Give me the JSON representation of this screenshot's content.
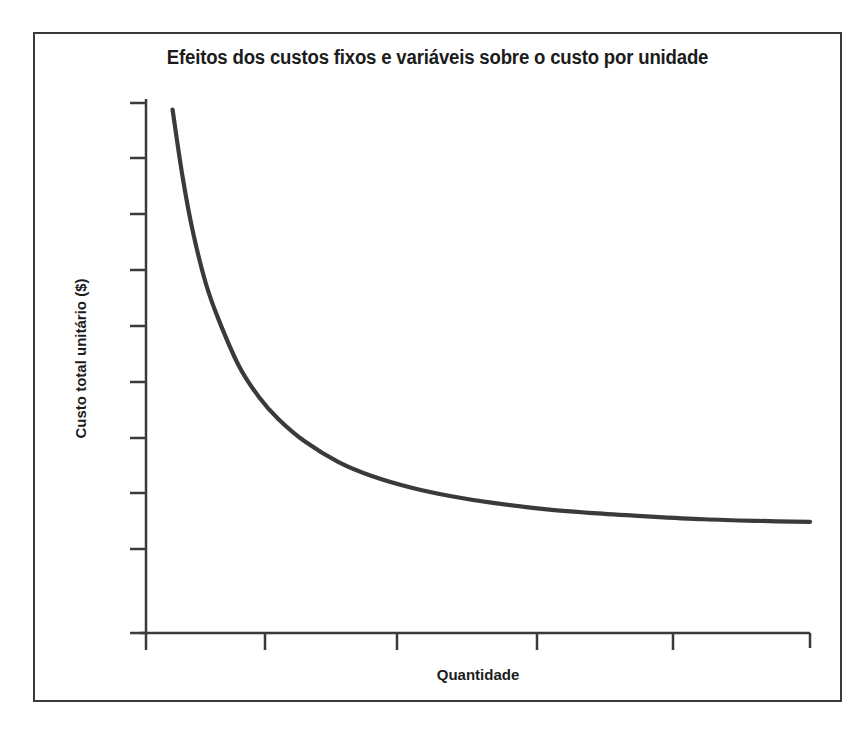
{
  "figure": {
    "title": "Efeitos dos custos fixos e variáveis sobre o custo por unidade",
    "frame_color": "#3a3a3a",
    "background_color": "#ffffff"
  },
  "axes": {
    "x_label": "Quantidade",
    "y_label": "Custo total unitário ($)",
    "axis_color": "#3a3a3a",
    "curve_color": "#3a3a3a"
  },
  "chart_data": {
    "type": "line",
    "title": "Efeitos dos custos fixos e variáveis sobre o custo por unidade",
    "xlabel": "Quantidade",
    "ylabel": "Custo total unitário ($)",
    "grid": false,
    "legend": null,
    "xlim": [
      0,
      10
    ],
    "ylim": [
      0,
      10
    ],
    "x_tick_labels": [],
    "y_tick_labels": [],
    "x_tick_count": 5,
    "y_tick_count": 10,
    "x_ticks": [
      2,
      4,
      6,
      8,
      10
    ],
    "y_ticks": [
      1,
      2,
      3,
      4,
      5,
      6,
      7,
      8,
      9,
      10
    ],
    "series": [
      {
        "name": "Custo total unitário",
        "description": "Curva decrescente hiperbólica: custo por unidade cai rapidamente e tende a uma assíntota horizontal",
        "x": [
          0.4,
          0.55,
          0.7,
          0.9,
          1.1,
          1.4,
          1.7,
          2.0,
          2.4,
          2.9,
          3.4,
          4.0,
          4.6,
          5.2,
          6.0,
          6.8,
          7.6,
          8.4,
          9.2,
          10.0
        ],
        "y": [
          9.8,
          8.55,
          7.55,
          6.55,
          5.85,
          5.0,
          4.42,
          4.0,
          3.58,
          3.2,
          2.94,
          2.72,
          2.56,
          2.44,
          2.32,
          2.24,
          2.18,
          2.13,
          2.1,
          2.08
        ]
      }
    ]
  }
}
